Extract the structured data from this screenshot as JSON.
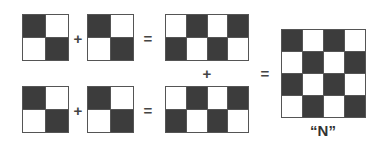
{
  "colors": {
    "dark": "#3c3c3c",
    "light": "#ffffff",
    "border": "#555555"
  },
  "grids": [
    {
      "id": "top-a",
      "x": 22,
      "y": 14,
      "w": 47,
      "h": 47,
      "rows": 2,
      "cols": 2,
      "cells": [
        1,
        0,
        0,
        1
      ]
    },
    {
      "id": "top-b",
      "x": 87,
      "y": 14,
      "w": 47,
      "h": 47,
      "rows": 2,
      "cols": 2,
      "cells": [
        1,
        0,
        0,
        1
      ]
    },
    {
      "id": "top-sum",
      "x": 165,
      "y": 14,
      "w": 84,
      "h": 47,
      "rows": 2,
      "cols": 4,
      "cells": [
        0,
        1,
        0,
        1,
        1,
        0,
        1,
        0
      ]
    },
    {
      "id": "bottom-a",
      "x": 22,
      "y": 86,
      "w": 47,
      "h": 47,
      "rows": 2,
      "cols": 2,
      "cells": [
        1,
        0,
        0,
        1
      ]
    },
    {
      "id": "bottom-b",
      "x": 87,
      "y": 86,
      "w": 47,
      "h": 47,
      "rows": 2,
      "cols": 2,
      "cells": [
        1,
        0,
        0,
        1
      ]
    },
    {
      "id": "bottom-sum",
      "x": 165,
      "y": 86,
      "w": 84,
      "h": 47,
      "rows": 2,
      "cols": 4,
      "cells": [
        0,
        1,
        0,
        1,
        1,
        0,
        1,
        0
      ]
    },
    {
      "id": "result-n",
      "x": 281,
      "y": 29,
      "w": 85,
      "h": 89,
      "rows": 4,
      "cols": 4,
      "cells": [
        1,
        0,
        1,
        0,
        0,
        1,
        0,
        1,
        1,
        0,
        1,
        0,
        0,
        1,
        0,
        1
      ]
    }
  ],
  "operators": [
    {
      "symbol": "+",
      "x": 78,
      "y": 38
    },
    {
      "symbol": "=",
      "x": 148,
      "y": 38
    },
    {
      "symbol": "+",
      "x": 78,
      "y": 110
    },
    {
      "symbol": "=",
      "x": 148,
      "y": 110
    },
    {
      "symbol": "+",
      "x": 207,
      "y": 73
    },
    {
      "symbol": "=",
      "x": 265,
      "y": 73
    }
  ],
  "result_label": {
    "text": "“N”",
    "x": 323,
    "y": 130
  }
}
